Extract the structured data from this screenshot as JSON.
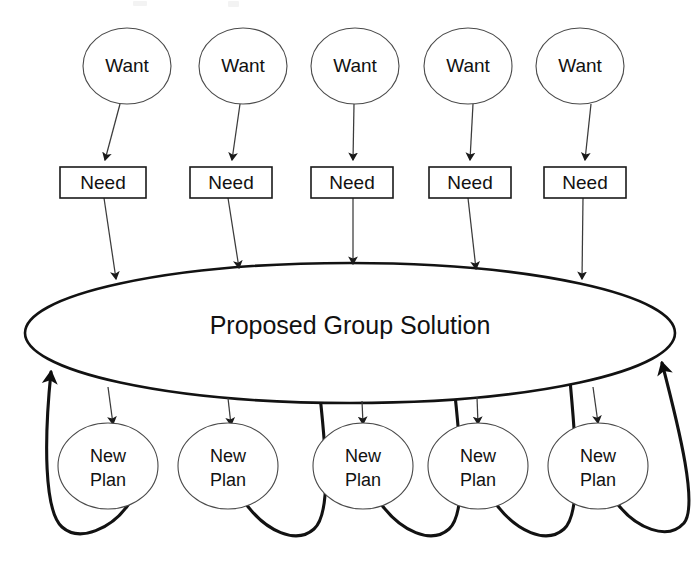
{
  "diagram": {
    "type": "flow-diagram",
    "canvas": {
      "width": 699,
      "height": 587,
      "background": "#ffffff"
    },
    "colors": {
      "background": "#ffffff",
      "thin_stroke": "#4a4a4a",
      "box_stroke": "#1a1a1a",
      "main_stroke": "#121212",
      "thick_edge": "#121212",
      "text": "#111111"
    },
    "center_node": {
      "label": "Proposed Group Solution",
      "shape": "ellipse",
      "cx": 350,
      "cy": 333,
      "rx": 325,
      "ry": 70,
      "text_y": 327
    },
    "columns": [
      {
        "index": 0,
        "want_cx": 127,
        "need_cx": 103,
        "plan_cx": 108,
        "loop_direction": "left"
      },
      {
        "index": 1,
        "want_cx": 243,
        "need_cx": 231,
        "plan_cx": 228,
        "loop_direction": "right"
      },
      {
        "index": 2,
        "want_cx": 355,
        "need_cx": 352,
        "plan_cx": 363,
        "loop_direction": "right"
      },
      {
        "index": 3,
        "want_cx": 468,
        "need_cx": 470,
        "plan_cx": 478,
        "loop_direction": "right"
      },
      {
        "index": 4,
        "want_cx": 580,
        "need_cx": 585,
        "plan_cx": 598,
        "loop_direction": "right"
      }
    ],
    "want_nodes": [
      {
        "label": "Want",
        "cx": 127,
        "cy": 66,
        "rx": 44,
        "ry": 38
      },
      {
        "label": "Want",
        "cx": 243,
        "cy": 66,
        "rx": 44,
        "ry": 38
      },
      {
        "label": "Want",
        "cx": 355,
        "cy": 66,
        "rx": 44,
        "ry": 38
      },
      {
        "label": "Want",
        "cx": 468,
        "cy": 66,
        "rx": 44,
        "ry": 38
      },
      {
        "label": "Want",
        "cx": 580,
        "cy": 66,
        "rx": 44,
        "ry": 38
      }
    ],
    "need_nodes": [
      {
        "label": "Need",
        "x": 60,
        "y": 167,
        "w": 86,
        "h": 31
      },
      {
        "label": "Need",
        "x": 190,
        "y": 167,
        "w": 82,
        "h": 31
      },
      {
        "label": "Need",
        "x": 311,
        "y": 167,
        "w": 82,
        "h": 31
      },
      {
        "label": "Need",
        "x": 429,
        "y": 167,
        "w": 82,
        "h": 31
      },
      {
        "label": "Need",
        "x": 544,
        "y": 167,
        "w": 82,
        "h": 31
      }
    ],
    "plan_nodes": [
      {
        "label_line1": "New",
        "label_line2": "Plan",
        "cx": 108,
        "cy": 466,
        "rx": 50,
        "ry": 43
      },
      {
        "label_line1": "New",
        "label_line2": "Plan",
        "cx": 228,
        "cy": 466,
        "rx": 50,
        "ry": 43
      },
      {
        "label_line1": "New",
        "label_line2": "Plan",
        "cx": 363,
        "cy": 466,
        "rx": 50,
        "ry": 43
      },
      {
        "label_line1": "New",
        "label_line2": "Plan",
        "cx": 478,
        "cy": 466,
        "rx": 50,
        "ry": 43
      },
      {
        "label_line1": "New",
        "label_line2": "Plan",
        "cx": 598,
        "cy": 466,
        "rx": 50,
        "ry": 43
      }
    ],
    "edges": {
      "want_to_need_count": 5,
      "need_to_solution_count": 5,
      "solution_to_plan_count": 5,
      "plan_to_solution_count": 5,
      "arrowhead_style": "solid-triangle"
    },
    "legend_text": {
      "want": "Want",
      "need": "Need",
      "new_plan_line1": "New",
      "new_plan_line2": "Plan",
      "solution": "Proposed Group Solution"
    }
  }
}
